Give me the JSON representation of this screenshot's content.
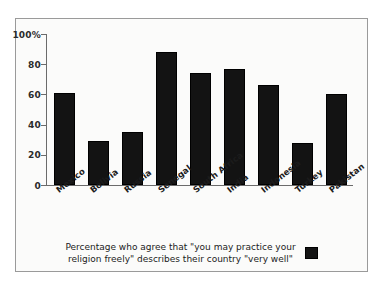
{
  "chart_data": {
    "type": "bar",
    "title": "",
    "subtitle": "",
    "xlabel": "",
    "ylabel": "",
    "ylim": [
      0,
      100
    ],
    "yticks": [
      0,
      20,
      40,
      60,
      80,
      100
    ],
    "ytick_labels": [
      "0",
      "20",
      "40",
      "60",
      "80",
      "100%"
    ],
    "grid": false,
    "legend_position": "bottom-right",
    "legend_entries": [
      "Percentage who agree"
    ],
    "bar_color": "#131313",
    "categories": [
      "Mexico",
      "Bolivia",
      "Russia",
      "Senegal",
      "South Africa",
      "India",
      "Indonesia",
      "Turkey",
      "Pakistan"
    ],
    "values": [
      61,
      29,
      35,
      88,
      74,
      77,
      66,
      28,
      60
    ],
    "annotations": []
  },
  "caption": {
    "line1": "Percentage who agree that \"you may practice your",
    "line2": "religion freely\" describes their country \"very well\"",
    "full": "Percentage who agree that \"you may practice your religion freely\" describes their country \"very well\""
  },
  "colors": {
    "bar": "#131313",
    "axis": "#6b6b6b",
    "border": "#9a9a9a",
    "background": "#fbfbfa",
    "text": "#1c1c1c"
  }
}
